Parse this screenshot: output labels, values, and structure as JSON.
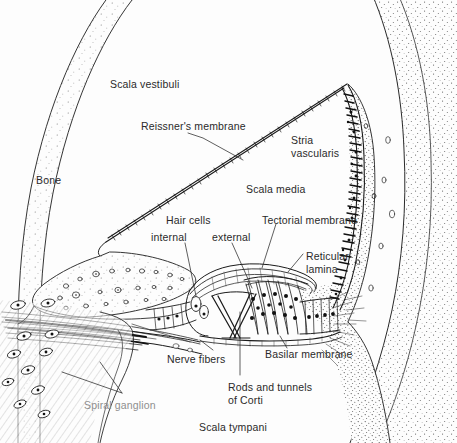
{
  "figure": {
    "domain": "anatomical-line-diagram",
    "width": 457,
    "height": 443,
    "background_color": "#fdfdfd",
    "ink_color": "#1a1a1a",
    "text_color": "#2a2a2a",
    "faded_text_color": "#8e8e8e"
  },
  "labels": {
    "scala_vestibuli": "Scala vestibuli",
    "reissners_membrane": "Reissner's membrane",
    "stria_vascularis_line1": "Stria",
    "stria_vascularis_line2": "vascularis",
    "bone": "Bone",
    "scala_media": "Scala media",
    "hair_cells": "Hair cells",
    "hair_cells_internal": "internal",
    "hair_cells_external": "external",
    "tectorial_membrane": "Tectorial membrane",
    "reticular_lamina_line1": "Reticular",
    "reticular_lamina_line2": "lamina",
    "nerve_fibers": "Nerve fibers",
    "rods_and_tunnels_line1": "Rods and tunnels",
    "rods_and_tunnels_line2": "of Corti",
    "basilar_membrane": "Basilar membrane",
    "spiral_ganglion": "Spiral ganglion",
    "scala_tympani": "Scala tympani"
  },
  "structures": [
    "outer bone capsule",
    "scala vestibuli",
    "Reissner's membrane",
    "scala media",
    "stria vascularis",
    "spiral ligament",
    "spiral limbus",
    "tectorial membrane",
    "inner hair cells",
    "outer hair cells",
    "reticular lamina",
    "rods and tunnel of Corti",
    "basilar membrane",
    "Claudius cells",
    "nerve fibers",
    "spiral ganglion",
    "scala tympani"
  ]
}
